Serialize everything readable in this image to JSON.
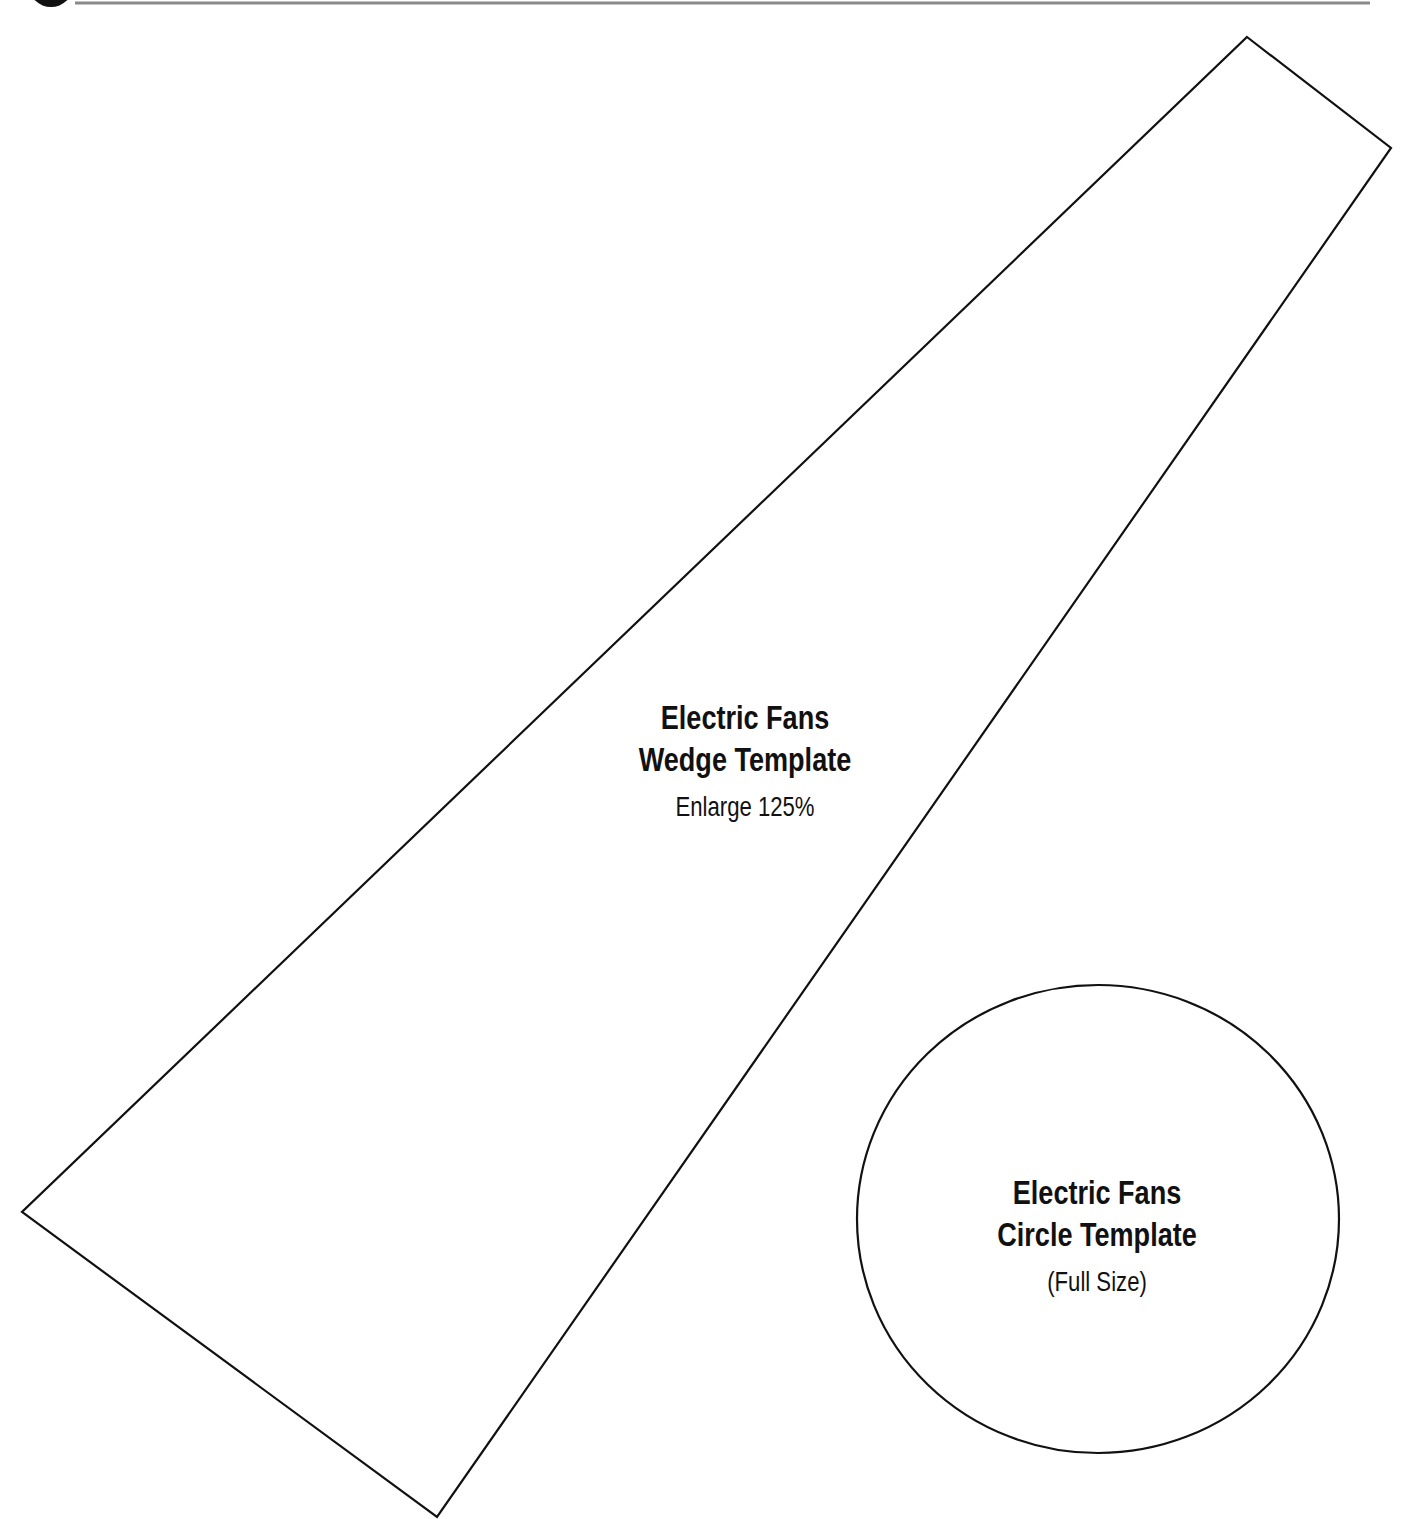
{
  "header": {
    "marker_icon": "black-circle-marker",
    "rule_color": "#8a8a8a"
  },
  "wedge_template": {
    "title_line1": "Electric Fans",
    "title_line2": "Wedge Template",
    "note": "Enlarge 125%",
    "outline_points": [
      [
        1247,
        37
      ],
      [
        1391,
        148
      ],
      [
        437,
        1517
      ],
      [
        22,
        1212
      ]
    ],
    "stroke_color": "#111111"
  },
  "circle_template": {
    "title_line1": "Electric Fans",
    "title_line2": "Circle Template",
    "note": "(Full Size)",
    "center": [
      1098,
      1219
    ],
    "rx": 241,
    "ry": 234,
    "stroke_color": "#111111"
  }
}
